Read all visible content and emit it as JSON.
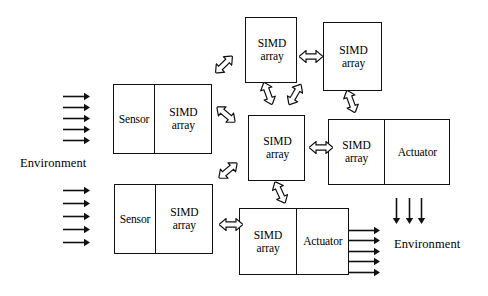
{
  "diagram": {
    "background_color": "#ffffff",
    "stroke_color": "#111111",
    "labels": {
      "environment_left": "Environment",
      "environment_right": "Environment"
    },
    "nodes": [
      {
        "id": "sensor-simd-top",
        "name": "sensor-simd-block-top",
        "x": 113,
        "y": 84,
        "w": 99,
        "h": 70,
        "cells": [
          {
            "line1": "Sensor",
            "line2": "",
            "w": 40
          },
          {
            "line1": "SIMD",
            "line2": "array",
            "w": 59
          }
        ]
      },
      {
        "id": "sensor-simd-bottom",
        "name": "sensor-simd-block-bottom",
        "x": 114,
        "y": 184,
        "w": 99,
        "h": 70,
        "cells": [
          {
            "line1": "Sensor",
            "line2": "",
            "w": 40
          },
          {
            "line1": "SIMD",
            "line2": "array",
            "w": 59
          }
        ]
      },
      {
        "id": "simd-top-left",
        "name": "simd-array-top-left",
        "x": 245,
        "y": 17,
        "w": 52,
        "h": 66,
        "cells": [
          {
            "line1": "SIMD",
            "line2": "array",
            "w": 52
          }
        ]
      },
      {
        "id": "simd-top-right",
        "name": "simd-array-top-right",
        "x": 323,
        "y": 22,
        "w": 59,
        "h": 69,
        "cells": [
          {
            "line1": "SIMD",
            "line2": "array",
            "w": 59
          }
        ]
      },
      {
        "id": "simd-center",
        "name": "simd-array-center",
        "x": 248,
        "y": 115,
        "w": 57,
        "h": 66,
        "cells": [
          {
            "line1": "SIMD",
            "line2": "array",
            "w": 57
          }
        ]
      },
      {
        "id": "simd-actuator-right",
        "name": "simd-actuator-block-right",
        "x": 328,
        "y": 119,
        "w": 122,
        "h": 66,
        "cells": [
          {
            "line1": "SIMD",
            "line2": "array",
            "w": 55
          },
          {
            "line1": "Actuator",
            "line2": "",
            "w": 67
          }
        ]
      },
      {
        "id": "simd-actuator-bottom",
        "name": "simd-actuator-block-bottom",
        "x": 239,
        "y": 208,
        "w": 110,
        "h": 67,
        "cells": [
          {
            "line1": "SIMD",
            "line2": "array",
            "w": 56
          },
          {
            "line1": "Actuator",
            "line2": "",
            "w": 54
          }
        ]
      }
    ],
    "input_arrows": {
      "name": "environment-input-arrows",
      "count": 5,
      "direction": "right",
      "groups": [
        {
          "x": 63,
          "y_start": 96,
          "spacing": 11,
          "length": 27
        },
        {
          "x": 63,
          "y_start": 190,
          "spacing": 13,
          "length": 27
        }
      ]
    },
    "output_arrows_right": {
      "name": "environment-output-arrows",
      "count": 5,
      "direction": "right",
      "x": 348,
      "y_start": 230,
      "spacing": 10.5,
      "length": 32
    },
    "output_arrows_down": {
      "name": "environment-output-arrows-down",
      "count": 3,
      "direction": "down",
      "y_start": 198,
      "length": 26,
      "xs": [
        396,
        409,
        421
      ]
    },
    "connectors": [
      {
        "name": "connector-sensor-top-to-simd-top-left",
        "x": 212,
        "y": 58,
        "angle": -45,
        "kind": "double-hollow"
      },
      {
        "name": "connector-sensor-top-to-simd-center",
        "x": 214,
        "y": 108,
        "angle": 40,
        "kind": "double-hollow"
      },
      {
        "name": "connector-simd-top-left-to-simd-top-right",
        "x": 299,
        "y": 50,
        "angle": 0,
        "kind": "double-hollow"
      },
      {
        "name": "connector-simd-top-left-to-simd-center",
        "x": 256,
        "y": 87,
        "angle": 70,
        "kind": "double-hollow"
      },
      {
        "name": "connector-simd-top-right-to-simd-center",
        "x": 283,
        "y": 88,
        "angle": -60,
        "kind": "double-hollow"
      },
      {
        "name": "connector-simd-top-right-to-simd-actuator-right",
        "x": 339,
        "y": 95,
        "angle": 70,
        "kind": "double-hollow"
      },
      {
        "name": "connector-simd-center-to-simd-actuator-right",
        "x": 309,
        "y": 141,
        "angle": 0,
        "kind": "double-hollow"
      },
      {
        "name": "connector-sensor-bottom-to-simd-center",
        "x": 216,
        "y": 164,
        "angle": -40,
        "kind": "double-hollow"
      },
      {
        "name": "connector-sensor-bottom-to-simd-actuator-bottom",
        "x": 219,
        "y": 218,
        "angle": 0,
        "kind": "double-hollow"
      },
      {
        "name": "connector-simd-center-to-simd-actuator-bottom",
        "x": 268,
        "y": 186,
        "angle": 65,
        "kind": "double-hollow"
      }
    ]
  }
}
